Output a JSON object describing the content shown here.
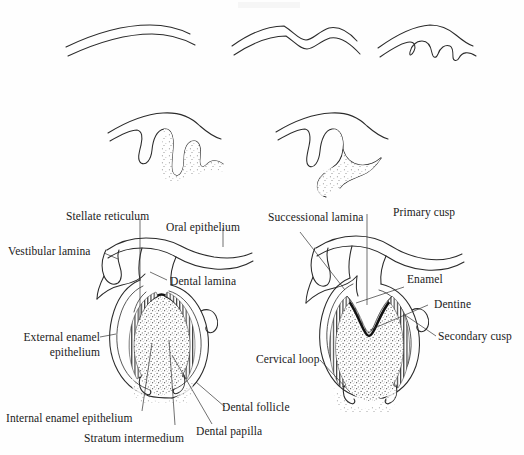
{
  "figure": {
    "background_color": "#fefefe",
    "ink_color": "#2a2a2a",
    "rows": [
      {
        "name": "row-1-early-stages",
        "stages": [
          "initiation / epithelial thickening",
          "bud stage",
          "early cap stage"
        ]
      },
      {
        "name": "row-2-cap-stages",
        "stages": [
          "cap stage",
          "advanced cap stage"
        ]
      },
      {
        "name": "row-3-bell-stages",
        "stages": [
          "early bell stage",
          "late bell stage / apposition"
        ]
      }
    ]
  },
  "labels": {
    "stellate_reticulum": "Stellate reticulum",
    "oral_epithelium": "Oral epithelium",
    "vestibular_lamina": "Vestibular lamina",
    "dental_lamina": "Dental lamina",
    "successional_lamina": "Successional lamina",
    "primary_cusp": "Primary cusp",
    "enamel": "Enamel",
    "dentine": "Dentine",
    "secondary_cusp": "Secondary cusp",
    "cervical_loop": "Cervical loop",
    "external_enamel_epithelium": "External enamel epithelium",
    "internal_enamel_epithelium": "Internal enamel epithelium",
    "stratum_intermedium": "Stratum intermedium",
    "dental_papilla": "Dental papilla",
    "dental_follicle": "Dental follicle"
  }
}
